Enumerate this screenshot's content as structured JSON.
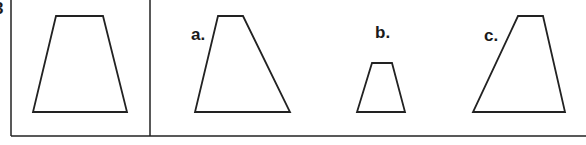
{
  "figure": {
    "partial_label_fragment": "3",
    "stroke_color": "#222222",
    "frame": {
      "left_line_x": 11,
      "divider_x": 150,
      "bottom_line_y": 136,
      "top_y": 0,
      "right_x": 586
    },
    "reference_shape": {
      "name": "reference-trapezoid",
      "points": [
        [
          56,
          16
        ],
        [
          103,
          16
        ],
        [
          127,
          112
        ],
        [
          33,
          112
        ]
      ]
    },
    "options": [
      {
        "label": "a.",
        "label_pos": [
          191,
          26
        ],
        "points": [
          [
            218,
            16
          ],
          [
            243,
            16
          ],
          [
            290,
            112
          ],
          [
            195,
            112
          ]
        ]
      },
      {
        "label": "b.",
        "label_pos": [
          375,
          24
        ],
        "points": [
          [
            372,
            63
          ],
          [
            392,
            63
          ],
          [
            405,
            112
          ],
          [
            357,
            112
          ]
        ]
      },
      {
        "label": "c.",
        "label_pos": [
          484,
          27
        ],
        "points": [
          [
            518,
            16
          ],
          [
            543,
            16
          ],
          [
            565,
            112
          ],
          [
            473,
            112
          ]
        ]
      }
    ]
  }
}
